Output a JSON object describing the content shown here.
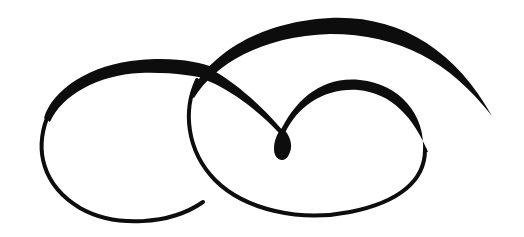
{
  "image": {
    "description": "Black calligraphic swirl flourish on white background",
    "colors": {
      "ink": "#0d0d0d",
      "background": "#ffffff"
    },
    "elements": [
      {
        "name": "left-loop-flourish"
      },
      {
        "name": "top-arc-flourish"
      },
      {
        "name": "right-loop-flourish"
      },
      {
        "name": "teardrop-knot"
      }
    ]
  }
}
